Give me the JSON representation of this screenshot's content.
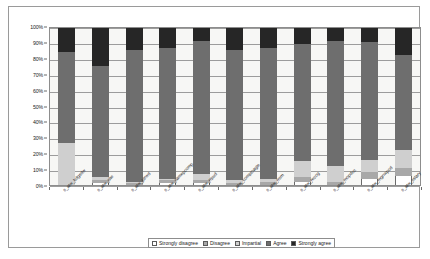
{
  "chart_data": {
    "type": "bar",
    "title": "",
    "xlabel": "",
    "ylabel": "",
    "ylim": [
      0,
      100
    ],
    "grid": true,
    "stacked": true,
    "stack_mode": "percent",
    "legend_position": "bottom",
    "y_ticks": [
      "0%",
      "10%",
      "20%",
      "30%",
      "40%",
      "50%",
      "60%",
      "70%",
      "80%",
      "90%",
      "100%"
    ],
    "categories": [
      "s_atw_bdgsdw",
      "s_atw_slte",
      "s_atw_ptrwd",
      "s_atw_samepcomp",
      "s_atw_rrpud",
      "s_atw_comptoagle",
      "s_atw_rrsm",
      "s_atw_recog",
      "s_atw_mopdoc",
      "s_atw_mgnwpod",
      "s_atw_sslary"
    ],
    "series": [
      {
        "name": "Strongly disagree",
        "color": "#ffffff",
        "values": [
          0,
          1,
          0,
          1,
          1,
          0,
          0,
          2,
          0,
          4,
          6
        ]
      },
      {
        "name": "Disagree",
        "color": "#a8a8a8",
        "values": [
          0,
          2,
          1,
          2,
          2,
          1,
          2,
          3,
          2,
          4,
          5
        ]
      },
      {
        "name": "Impartial",
        "color": "#cfcfcf",
        "values": [
          27,
          2,
          1,
          1,
          4,
          2,
          2,
          10,
          10,
          8,
          11
        ]
      },
      {
        "name": "Agree",
        "color": "#6e6e6e",
        "values": [
          58,
          71,
          84,
          83,
          85,
          83,
          83,
          75,
          80,
          75,
          61
        ]
      },
      {
        "name": "Strongly agree",
        "color": "#262626",
        "values": [
          15,
          24,
          14,
          13,
          8,
          14,
          13,
          10,
          8,
          9,
          17
        ]
      }
    ]
  }
}
